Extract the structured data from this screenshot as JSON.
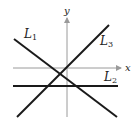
{
  "figure": {
    "axes": {
      "x_label": "x",
      "y_label": "y",
      "axis_color": "#9a9a9a",
      "origin": [
        67,
        68
      ],
      "x_axis": {
        "x1": 13,
        "x2": 121,
        "y": 68
      },
      "y_axis": {
        "x": 67,
        "y1": 117,
        "y2": 18
      }
    },
    "lines": [
      {
        "id": "L1",
        "label": "L",
        "subscript": "1",
        "x1": 14,
        "y1": 39,
        "x2": 117,
        "y2": 117,
        "label_pos": [
          24,
          38
        ],
        "description": "negative slope"
      },
      {
        "id": "L2",
        "label": "L",
        "subscript": "2",
        "x1": 13,
        "y1": 86,
        "x2": 118,
        "y2": 86,
        "label_pos": [
          104,
          81
        ],
        "description": "horizontal, zero slope"
      },
      {
        "id": "L3",
        "label": "L",
        "subscript": "3",
        "x1": 17,
        "y1": 117,
        "x2": 109,
        "y2": 25,
        "label_pos": [
          100,
          45
        ],
        "description": "positive slope"
      }
    ],
    "line_color": "#1a1a1a"
  }
}
